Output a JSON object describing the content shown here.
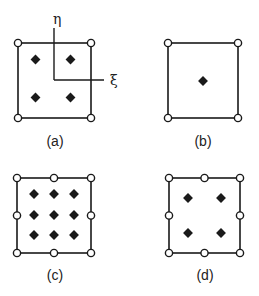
{
  "figure": {
    "colors": {
      "stroke": "#1a1a1a",
      "node_fill": "#ffffff",
      "gauss_fill": "#1a1a1a",
      "background": "#ffffff"
    },
    "axes_labels": {
      "eta": "η",
      "xi": "ξ"
    },
    "legend": {
      "node_marker": "open-circle (element node)",
      "gauss_marker": "filled-diamond (integration point)"
    },
    "panels": [
      {
        "id": "a",
        "label": "(a)",
        "nodes": 4,
        "gauss_points": "2x2",
        "gauss_count": 4,
        "has_local_axes": true
      },
      {
        "id": "b",
        "label": "(b)",
        "nodes": 4,
        "gauss_points": "1x1",
        "gauss_count": 1,
        "has_local_axes": false
      },
      {
        "id": "c",
        "label": "(c)",
        "nodes": 8,
        "gauss_points": "3x3",
        "gauss_count": 9,
        "has_local_axes": false
      },
      {
        "id": "d",
        "label": "(d)",
        "nodes": 8,
        "gauss_points": "2x2",
        "gauss_count": 4,
        "has_local_axes": false
      }
    ]
  }
}
